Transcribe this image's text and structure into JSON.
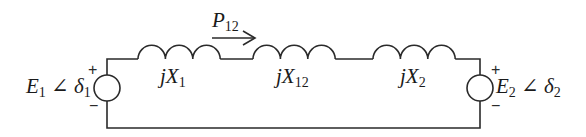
{
  "diagram": {
    "type": "two-source transmission line equivalent circuit",
    "power_flow": {
      "symbol": "P",
      "subscript": "12",
      "direction": "left-to-right"
    },
    "sources": [
      {
        "id": "source-1",
        "symbol": "E",
        "subscript": "1",
        "angle_symbol": "∠",
        "angle": "δ",
        "angle_subscript": "1",
        "plus": "+",
        "minus": "−",
        "side": "left"
      },
      {
        "id": "source-2",
        "symbol": "E",
        "subscript": "2",
        "angle_symbol": "∠",
        "angle": "δ",
        "angle_subscript": "2",
        "plus": "+",
        "minus": "−",
        "side": "right"
      }
    ],
    "reactances": [
      {
        "id": "x1",
        "prefix": "j",
        "symbol": "X",
        "subscript": "1"
      },
      {
        "id": "x12",
        "prefix": "j",
        "symbol": "X",
        "subscript": "12"
      },
      {
        "id": "x2",
        "prefix": "j",
        "symbol": "X",
        "subscript": "2"
      }
    ],
    "colors": {
      "line": "#2a2a2a",
      "text": "#1a1a1a",
      "background": "#ffffff"
    }
  }
}
